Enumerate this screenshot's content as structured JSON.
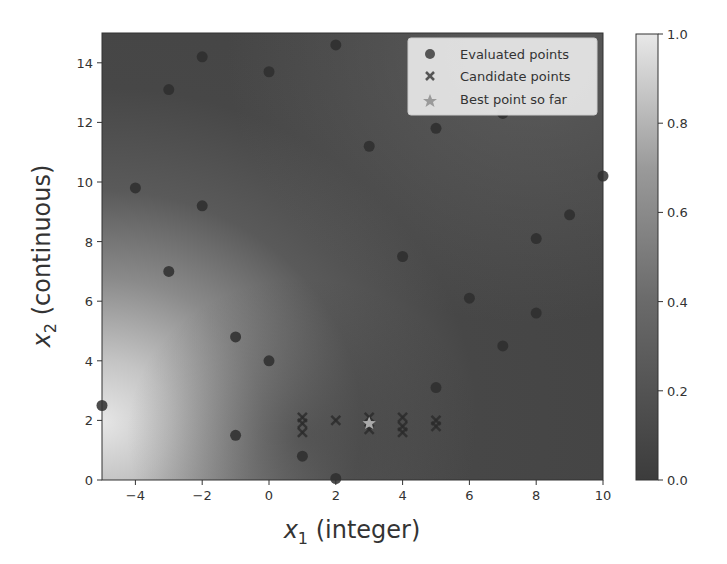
{
  "chart_data": {
    "type": "scatter",
    "title": "",
    "xlabel": "x1 (integer)",
    "xlabel_main": "x",
    "xlabel_sub": "1",
    "xlabel_rest": " (integer)",
    "ylabel": "x2 (continuous)",
    "ylabel_main": "x",
    "ylabel_sub": "2",
    "ylabel_rest": " (continuous)",
    "xlim": [
      -5,
      10
    ],
    "ylim": [
      0,
      15
    ],
    "xticks": [
      -4,
      -2,
      0,
      2,
      4,
      6,
      8,
      10
    ],
    "xtick_labels": [
      "−4",
      "−2",
      "0",
      "2",
      "4",
      "6",
      "8",
      "10"
    ],
    "yticks": [
      0,
      2,
      4,
      6,
      8,
      10,
      12,
      14
    ],
    "ytick_labels": [
      "0",
      "2",
      "4",
      "6",
      "8",
      "10",
      "12",
      "14"
    ],
    "grid": false,
    "background": "heatmap (grayscale contour of normalized objective, brightest near x1=-5, x2=2)",
    "colorbar": {
      "range": [
        0.0,
        1.0
      ],
      "ticks": [
        0.0,
        0.2,
        0.4,
        0.6,
        0.8,
        1.0
      ],
      "tick_labels": [
        "0.0",
        "0.2",
        "0.4",
        "0.6",
        "0.8",
        "1.0"
      ],
      "color_low": "#3c3c3c",
      "color_high": "#e8e8e8"
    },
    "legend": {
      "position": "upper right",
      "entries": [
        {
          "label": "Evaluated points",
          "marker": "circle"
        },
        {
          "label": "Candidate points",
          "marker": "x"
        },
        {
          "label": "Best point so far",
          "marker": "star"
        }
      ]
    },
    "series": [
      {
        "name": "Evaluated points",
        "marker": "circle",
        "color": "#2e2e2e",
        "points": [
          [
            -5,
            2.5
          ],
          [
            -4,
            9.8
          ],
          [
            -3,
            13.1
          ],
          [
            -3,
            7.0
          ],
          [
            -2,
            14.2
          ],
          [
            -2,
            9.2
          ],
          [
            -1,
            4.8
          ],
          [
            -1,
            1.5
          ],
          [
            0,
            13.7
          ],
          [
            0,
            4.0
          ],
          [
            1,
            0.8
          ],
          [
            2,
            14.6
          ],
          [
            2,
            0.05
          ],
          [
            3,
            11.2
          ],
          [
            4,
            7.5
          ],
          [
            5,
            11.8
          ],
          [
            5,
            3.1
          ],
          [
            6,
            6.1
          ],
          [
            7,
            12.3
          ],
          [
            7,
            4.5
          ],
          [
            8,
            8.1
          ],
          [
            8,
            5.6
          ],
          [
            9,
            8.9
          ],
          [
            10,
            10.2
          ]
        ]
      },
      {
        "name": "Candidate points",
        "marker": "x",
        "color": "#2a2a2a",
        "points": [
          [
            1,
            2.1
          ],
          [
            1,
            1.9
          ],
          [
            1,
            1.6
          ],
          [
            2,
            2.0
          ],
          [
            3,
            2.1
          ],
          [
            3,
            1.7
          ],
          [
            4,
            2.1
          ],
          [
            4,
            1.8
          ],
          [
            4,
            1.6
          ],
          [
            5,
            2.0
          ],
          [
            5,
            1.8
          ]
        ]
      },
      {
        "name": "Best point so far",
        "marker": "star",
        "color": "#aaaaaa",
        "points": [
          [
            3,
            1.9
          ]
        ]
      }
    ]
  }
}
